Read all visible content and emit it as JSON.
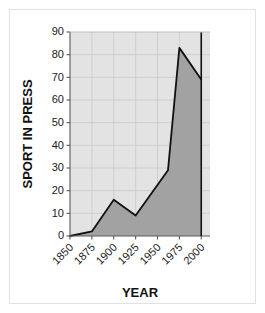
{
  "chart_data": {
    "type": "area",
    "title": "",
    "xlabel": "YEAR",
    "ylabel": "SPORT IN PRESS",
    "x": [
      1850,
      1875,
      1900,
      1925,
      1962,
      1975,
      2000
    ],
    "values": [
      0,
      2,
      16,
      9,
      29,
      83,
      69
    ],
    "series": [
      {
        "name": "SPORT IN PRESS",
        "values": [
          0,
          2,
          16,
          9,
          29,
          83,
          69
        ]
      }
    ],
    "xticks": [
      "1850",
      "1875",
      "1900",
      "1925",
      "1950",
      "1975",
      "2000"
    ],
    "xtick_values": [
      1850,
      1875,
      1900,
      1925,
      1950,
      1975,
      2000
    ],
    "yticks": [
      "0",
      "10",
      "20",
      "30",
      "40",
      "50",
      "60",
      "70",
      "80",
      "90"
    ],
    "ytick_values": [
      0,
      10,
      20,
      30,
      40,
      50,
      60,
      70,
      80,
      90
    ],
    "xlim": [
      1850,
      2010
    ],
    "ylim": [
      0,
      90
    ],
    "grid": true,
    "legend": "none",
    "xtick_rotation": 45,
    "colors": {
      "plot_background": "#e3e3e3",
      "area_fill": "#a2a2a2",
      "line": "#111111",
      "grid": "#c9c9c9",
      "axis": "#5a5a5a",
      "text": "#1a1a1a",
      "frame": "#e2e2e2",
      "page_background": "#ffffff"
    }
  }
}
